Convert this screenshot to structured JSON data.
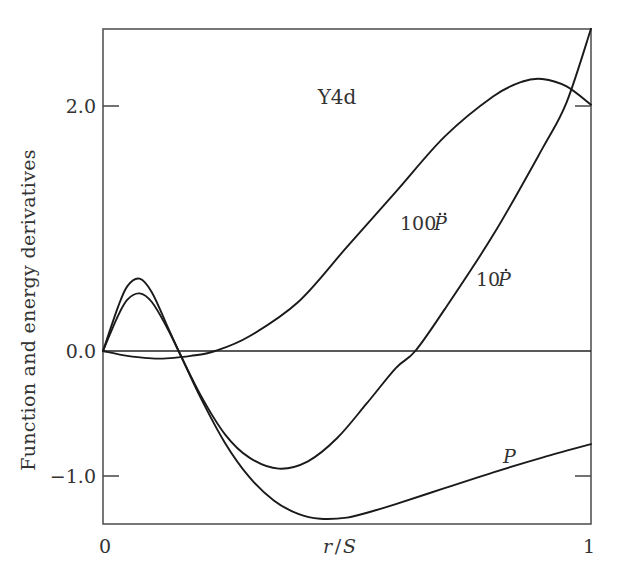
{
  "chart_data": {
    "type": "line",
    "title": "Y4d",
    "xlabel": "r/S",
    "ylabel": "Function and energy derivatives",
    "xlim": [
      0,
      1
    ],
    "ylim": [
      -1.41,
      2.63
    ],
    "x_ticks": [
      "0",
      "1"
    ],
    "y_ticks": [
      "2.0",
      "0.0",
      "−1.0"
    ],
    "y_tick_values": [
      2.0,
      0.0,
      -1.0
    ],
    "grid": false,
    "legend": "inline labels",
    "reference_line": {
      "y": 0.0
    },
    "series": [
      {
        "name": "P",
        "label": "P",
        "x": [
          0,
          0.03,
          0.05,
          0.075,
          0.1,
          0.13,
          0.155,
          0.2,
          0.25,
          0.3,
          0.35,
          0.4,
          0.445,
          0.5,
          0.55,
          0.6,
          0.7,
          0.8,
          0.9,
          1.0
        ],
        "y": [
          0,
          0.28,
          0.42,
          0.47,
          0.4,
          0.2,
          0.0,
          -0.38,
          -0.75,
          -1.03,
          -1.22,
          -1.33,
          -1.37,
          -1.36,
          -1.31,
          -1.25,
          -1.12,
          -0.99,
          -0.87,
          -0.76
        ]
      },
      {
        "name": "10Ṗ",
        "label": "10Ṗ",
        "x": [
          0,
          0.03,
          0.05,
          0.075,
          0.1,
          0.13,
          0.155,
          0.2,
          0.25,
          0.3,
          0.36,
          0.42,
          0.48,
          0.54,
          0.6,
          0.64,
          0.7,
          0.8,
          0.9,
          0.95,
          1.0
        ],
        "y": [
          0,
          0.35,
          0.53,
          0.59,
          0.48,
          0.22,
          0.0,
          -0.36,
          -0.68,
          -0.87,
          -0.96,
          -0.9,
          -0.71,
          -0.43,
          -0.14,
          0.0,
          0.34,
          0.95,
          1.65,
          2.03,
          2.63
        ]
      },
      {
        "name": "100P̈",
        "label": "100P̈",
        "x": [
          0,
          0.05,
          0.1,
          0.13,
          0.18,
          0.23,
          0.3,
          0.4,
          0.5,
          0.6,
          0.7,
          0.8,
          0.86,
          0.9,
          0.95,
          1.0
        ],
        "y": [
          0,
          -0.04,
          -0.06,
          -0.06,
          -0.04,
          0.0,
          0.12,
          0.4,
          0.85,
          1.3,
          1.75,
          2.08,
          2.2,
          2.22,
          2.16,
          2.01
        ]
      }
    ],
    "annotations": [
      {
        "text": "Y4d",
        "x": 0.43,
        "y": 2.0
      },
      {
        "text": "100P̈",
        "x": 0.53,
        "y": 1.0
      },
      {
        "text": "10Ṗ",
        "x": 0.77,
        "y": 0.6
      },
      {
        "text": "P",
        "x": 0.845,
        "y": -0.87
      }
    ]
  },
  "labels": {
    "title": "Y4d",
    "xlabel_r": "r",
    "xlabel_slash": "/",
    "xlabel_S": "S",
    "ylabel": "Function and energy derivatives",
    "xtick_0": "0",
    "xtick_1": "1",
    "ytick_2": "2.0",
    "ytick_0": "0.0",
    "ytick_m1": "−1.0",
    "curve_P": "P",
    "curve_10Pdot_num": "10",
    "curve_10Pdot_var": "P",
    "curve_100Pddot_num": "100",
    "curve_100Pddot_var": "P"
  },
  "colors": {
    "axis": "#444444",
    "curve": "#1a1a1a",
    "text": "#333333",
    "background": "#ffffff"
  }
}
